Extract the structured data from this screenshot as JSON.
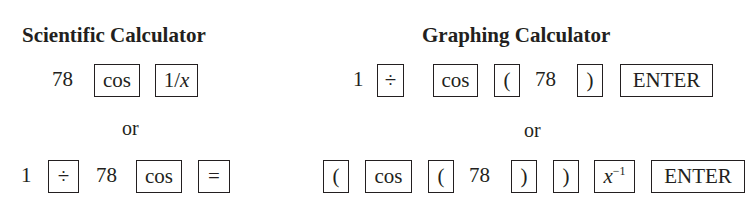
{
  "scientific": {
    "title": "Scientific Calculator",
    "method1": {
      "number": "78",
      "keys": [
        "cos",
        "1/x"
      ]
    },
    "or_label": "or",
    "method2": {
      "lead": "1",
      "key_divide": "÷",
      "number": "78",
      "key_cos": "cos",
      "key_equals": "="
    }
  },
  "graphing": {
    "title": "Graphing Calculator",
    "method1": {
      "lead": "1",
      "key_divide": "÷",
      "key_cos": "cos",
      "key_open_paren": "(",
      "number": "78",
      "key_close_paren": ")",
      "key_enter": "ENTER"
    },
    "or_label": "or",
    "method2": {
      "key_open_paren_1": "(",
      "key_cos": "cos",
      "key_open_paren_2": "(",
      "number": "78",
      "key_close_paren_1": ")",
      "key_close_paren_2": ")",
      "key_inverse_base": "x",
      "key_inverse_exp": "−1",
      "key_enter": "ENTER"
    }
  }
}
